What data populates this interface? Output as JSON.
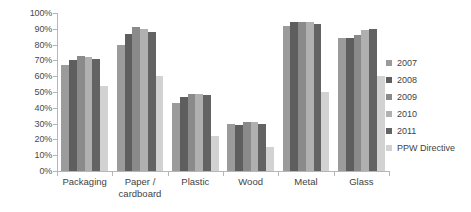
{
  "chart_data": {
    "type": "bar",
    "title": "",
    "subtitle": "",
    "xlabel": "",
    "ylabel": "",
    "ylim": [
      0,
      100
    ],
    "y_unit": "%",
    "grid": false,
    "legend_position": "right",
    "categories": [
      "Packaging",
      "Paper /\ncardboard",
      "Plastic",
      "Wood",
      "Metal",
      "Glass"
    ],
    "y_ticks": [
      "0%",
      "10%",
      "20%",
      "30%",
      "40%",
      "50%",
      "60%",
      "70%",
      "80%",
      "90%",
      "100%"
    ],
    "y_tick_values": [
      0,
      10,
      20,
      30,
      40,
      50,
      60,
      70,
      80,
      90,
      100
    ],
    "series": [
      {
        "name": "2007",
        "color": "#9b9b9b",
        "values": [
          67,
          80,
          43,
          30,
          92,
          84
        ]
      },
      {
        "name": "2008",
        "color": "#5e5e5e",
        "values": [
          70,
          87,
          47,
          29,
          94,
          84
        ]
      },
      {
        "name": "2009",
        "color": "#8a8a8a",
        "values": [
          73,
          91,
          49,
          31,
          94,
          86
        ]
      },
      {
        "name": "2010",
        "color": "#b0b0b0",
        "values": [
          72,
          90,
          49,
          31,
          94,
          89
        ]
      },
      {
        "name": "2011",
        "color": "#636363",
        "values": [
          71,
          88,
          48,
          30,
          93,
          90
        ]
      },
      {
        "name": "PPW Directive",
        "color": "#d2d2d2",
        "values": [
          54,
          60,
          22,
          15,
          50,
          60
        ]
      }
    ]
  },
  "legend": {
    "items": [
      {
        "label": "2007",
        "color": "#9b9b9b"
      },
      {
        "label": "2008",
        "color": "#5e5e5e"
      },
      {
        "label": "2009",
        "color": "#8a8a8a"
      },
      {
        "label": "2010",
        "color": "#b0b0b0"
      },
      {
        "label": "2011",
        "color": "#636363"
      },
      {
        "label": "PPW Directive",
        "color": "#d2d2d2"
      }
    ]
  },
  "axis": {
    "y_max_label": "100%",
    "y_min_label": "0%"
  },
  "colors": {
    "axis_line": "#b6b6b6",
    "text": "#3f3f3f",
    "background": "#ffffff"
  }
}
